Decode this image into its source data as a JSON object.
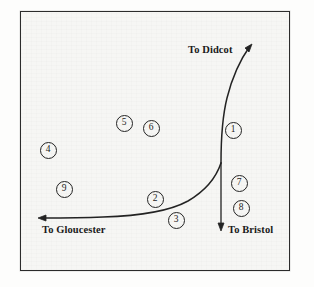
{
  "figure": {
    "kind": "railway-junction-sketch-map",
    "background_color": "#fdfdfc",
    "paper_color": "#f6f6f4",
    "ink_color": "#232323",
    "frame": {
      "x": 20,
      "y": 11,
      "width": 270,
      "height": 260
    }
  },
  "routes": [
    {
      "id": "didcot-line",
      "destination_label": "To Didcot",
      "direction": "up-right",
      "arrow_tip": {
        "x": 252,
        "y": 44
      },
      "junction": {
        "x": 221,
        "y": 163
      }
    },
    {
      "id": "gloucester-line",
      "destination_label": "To Gloucester",
      "direction": "left",
      "arrow_tip": {
        "x": 38,
        "y": 218
      },
      "junction": {
        "x": 221,
        "y": 163
      }
    },
    {
      "id": "bristol-line",
      "destination_label": "To Bristol",
      "direction": "down",
      "arrow_tip": {
        "x": 221,
        "y": 230
      },
      "junction": {
        "x": 221,
        "y": 163
      }
    }
  ],
  "labels": [
    {
      "name": "to-didcot",
      "text": "To Didcot",
      "x": 188,
      "y": 49,
      "anchor": "left"
    },
    {
      "name": "to-gloucester",
      "text": "To Gloucester",
      "x": 42,
      "y": 229,
      "anchor": "left"
    },
    {
      "name": "to-bristol",
      "text": "To Bristol",
      "x": 228,
      "y": 229,
      "anchor": "left"
    }
  ],
  "markers": [
    {
      "id": 1,
      "text": "1",
      "x": 232,
      "y": 129
    },
    {
      "id": 2,
      "text": "2",
      "x": 154,
      "y": 198
    },
    {
      "id": 3,
      "text": "3",
      "x": 175,
      "y": 219
    },
    {
      "id": 4,
      "text": "4",
      "x": 47,
      "y": 149
    },
    {
      "id": 5,
      "text": "5",
      "x": 123,
      "y": 122
    },
    {
      "id": 6,
      "text": "6",
      "x": 150,
      "y": 127
    },
    {
      "id": 7,
      "text": "7",
      "x": 238,
      "y": 182
    },
    {
      "id": 8,
      "text": "8",
      "x": 240,
      "y": 207
    },
    {
      "id": 9,
      "text": "9",
      "x": 63,
      "y": 188
    }
  ]
}
